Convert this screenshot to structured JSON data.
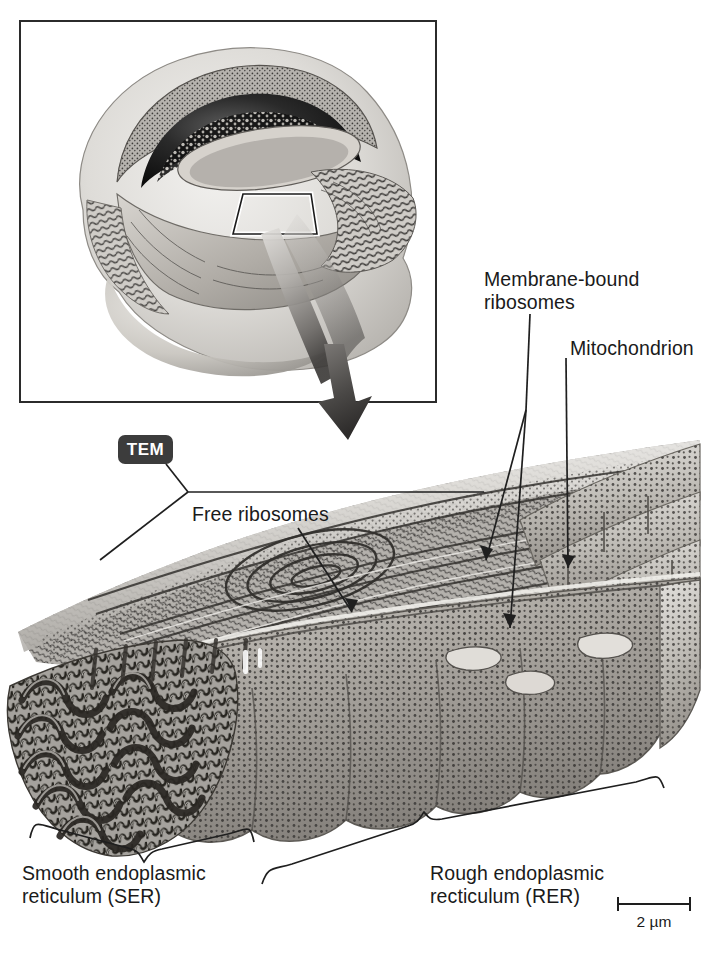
{
  "figure": {
    "background_color": "#ffffff",
    "text_color": "#1a1a1a"
  },
  "inset": {
    "name": "cell-overview-illustration",
    "description": "Grayscale cut-away drawing of an animal cell with nucleus and endoplasmic reticulum",
    "highlight_box": "region-of-interest-box",
    "arrow": "magnification-arrow"
  },
  "badges": {
    "tem": {
      "label": "TEM",
      "background_color": "#3c3c3c",
      "text_color": "#ffffff"
    }
  },
  "labels": {
    "membrane_bound_ribosomes": "Membrane-bound\nribosomes",
    "mitochondrion": "Mitochondrion",
    "free_ribosomes": "Free ribosomes",
    "smooth_er": "Smooth endoplasmic\nreticulum (SER)",
    "rough_er": "Rough endoplasmic\nrecticulum (RER)"
  },
  "scale_bar": {
    "label": "2 µm",
    "length_value": 2,
    "length_units": "µm"
  },
  "micrograph": {
    "name": "er-transmission-electron-micrograph",
    "description": "Three-dimensional cut-away rendering of rough and smooth endoplasmic reticulum with ribosome-studded cisternae"
  }
}
